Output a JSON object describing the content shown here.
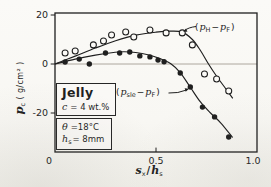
{
  "figure": {
    "colors": {
      "ink": "#1f1f1f",
      "paper": "#fbfaf7",
      "zero_line": "#999288"
    },
    "y_axis": {
      "symbol": "p",
      "symbol_sub": "c",
      "units": " ( g/cm² )"
    },
    "x_axis": {
      "sym1": "s",
      "sub1": "x",
      "divider": "/",
      "sym2": "h",
      "sub2": "s"
    },
    "legend_open_series": {
      "pre": "(",
      "sym1": "p",
      "sub1": "H",
      "minus": "−",
      "sym2": "p",
      "sub2": "F",
      "post": ")"
    },
    "legend_filled_series": {
      "pre": "(",
      "sym1": "p",
      "sub1": "sle",
      "minus": "−",
      "sym2": "p",
      "sub2": "F",
      "post": ")"
    },
    "info_box_top": {
      "title": "Jelly",
      "sym": "c",
      "value": "= 4 wt.%"
    },
    "info_box_bottom": {
      "line1_sym": "θ",
      "line1_value": "=18°C",
      "line2_sym": "h",
      "line2_sub": "s",
      "line2_value": "= 8mm"
    }
  },
  "chart_data": {
    "type": "scatter",
    "title": "",
    "xlabel": "s_x / h_s",
    "ylabel": "p_c ( g/cm² )",
    "xlim": [
      0,
      1.0
    ],
    "ylim": [
      -36,
      21
    ],
    "grid": false,
    "zero_line": true,
    "x_ticks": [
      {
        "v": 0,
        "label": "0"
      },
      {
        "v": 0.5,
        "label": "0.5"
      },
      {
        "v": 1.0,
        "label": "1.0"
      }
    ],
    "y_ticks": [
      {
        "v": 20,
        "label": "20"
      },
      {
        "v": 0,
        "label": "0"
      },
      {
        "v": -20,
        "label": "-20"
      }
    ],
    "conditions": [
      "Jelly",
      "c = 4 wt.%",
      "θ = 18°C",
      "h_s = 8 mm"
    ],
    "series": [
      {
        "name": "(p_H − p_F)",
        "marker": "open-circle",
        "points": [
          [
            0.05,
            4.5
          ],
          [
            0.1,
            5.3
          ],
          [
            0.19,
            7.8
          ],
          [
            0.24,
            9.4
          ],
          [
            0.28,
            11.8
          ],
          [
            0.35,
            13.1
          ],
          [
            0.39,
            11.0
          ],
          [
            0.47,
            13.9
          ],
          [
            0.55,
            12.7
          ],
          [
            0.63,
            12.7
          ],
          [
            0.68,
            7.8
          ],
          [
            0.74,
            -4.1
          ],
          [
            0.8,
            -6.1
          ],
          [
            0.86,
            -11.0
          ]
        ]
      },
      {
        "name": "(p_sle − p_F)",
        "marker": "filled-circle",
        "points": [
          [
            0.05,
            0.8
          ],
          [
            0.12,
            2.0
          ],
          [
            0.17,
            0.0
          ],
          [
            0.25,
            4.5
          ],
          [
            0.32,
            4.5
          ],
          [
            0.37,
            4.9
          ],
          [
            0.42,
            3.3
          ],
          [
            0.47,
            2.9
          ],
          [
            0.51,
            1.6
          ],
          [
            0.54,
            0.9
          ],
          [
            0.62,
            -3.7
          ],
          [
            0.67,
            -9.4
          ],
          [
            0.73,
            -17.6
          ],
          [
            0.79,
            -21.6
          ],
          [
            0.86,
            -29.8
          ]
        ]
      }
    ],
    "fit_curves": [
      {
        "series": "(p_H − p_F)",
        "points": [
          [
            0,
            0
          ],
          [
            0.1,
            3.2
          ],
          [
            0.2,
            6.5
          ],
          [
            0.3,
            9.5
          ],
          [
            0.4,
            11.8
          ],
          [
            0.5,
            13.0
          ],
          [
            0.57,
            13.4
          ],
          [
            0.63,
            13.0
          ],
          [
            0.68,
            10.0
          ],
          [
            0.72,
            5.5
          ],
          [
            0.76,
            0.0
          ],
          [
            0.8,
            -5.0
          ],
          [
            0.84,
            -9.5
          ],
          [
            0.88,
            -14.0
          ]
        ]
      },
      {
        "series": "(p_sle − p_F)",
        "points": [
          [
            0,
            0
          ],
          [
            0.1,
            2.0
          ],
          [
            0.2,
            3.6
          ],
          [
            0.28,
            4.6
          ],
          [
            0.34,
            5.0
          ],
          [
            0.4,
            4.7
          ],
          [
            0.46,
            3.8
          ],
          [
            0.52,
            2.2
          ],
          [
            0.575,
            0.0
          ],
          [
            0.62,
            -3.5
          ],
          [
            0.67,
            -9.5
          ],
          [
            0.72,
            -15.5
          ],
          [
            0.77,
            -20.0
          ],
          [
            0.82,
            -24.0
          ],
          [
            0.88,
            -30.0
          ]
        ]
      }
    ]
  }
}
